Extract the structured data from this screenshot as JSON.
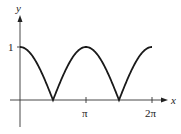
{
  "chart_data": {
    "type": "line",
    "title": "",
    "function": "|cos(x)|",
    "xlabel": "x",
    "ylabel": "y",
    "xlim": [
      0,
      6.2832
    ],
    "ylim": [
      0,
      1
    ],
    "x_ticks": [
      {
        "value": 3.1416,
        "label": "π"
      },
      {
        "value": 6.2832,
        "label": "2π"
      }
    ],
    "y_ticks": [
      {
        "value": 1,
        "label": "1"
      }
    ],
    "grid": false,
    "legend": null,
    "series": [
      {
        "name": "y = |cos x|",
        "x": [
          0,
          0.3927,
          0.7854,
          1.1781,
          1.5708,
          1.9635,
          2.3562,
          2.7489,
          3.1416,
          3.5343,
          3.927,
          4.3197,
          4.7124,
          5.1051,
          5.4978,
          5.8905,
          6.2832
        ],
        "values": [
          1,
          0.924,
          0.707,
          0.383,
          0,
          0.383,
          0.707,
          0.924,
          1,
          0.924,
          0.707,
          0.383,
          0,
          0.383,
          0.707,
          0.924,
          1
        ]
      }
    ]
  },
  "labels": {
    "x_axis": "x",
    "y_axis": "y",
    "y_one": "1",
    "x_pi": "π",
    "x_two_pi": "2π"
  },
  "colors": {
    "curve": "#1a1a1a",
    "axis": "#333333"
  }
}
